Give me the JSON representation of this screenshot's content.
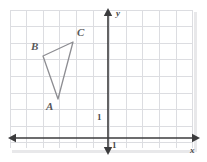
{
  "figure": {
    "type": "coordinate-grid-triangle",
    "background_color": "#ffffff",
    "grid_color": "#dcdde1",
    "axis_color": "#3b3b3d",
    "shape_color": "#8d8d92",
    "label_color": "#58585a"
  },
  "grid": {
    "left": 10,
    "top": 10,
    "right": 193,
    "bottom": 148,
    "cell": 16.6,
    "x_lines": [
      10,
      26.6,
      43.2,
      59.8,
      76.4,
      93,
      109.6,
      126.2,
      142.8,
      159.4,
      176,
      192.6
    ],
    "y_lines": [
      10,
      26.6,
      43.2,
      59.8,
      76.4,
      93,
      109.6,
      126.2,
      142.8
    ]
  },
  "axes": {
    "y_axis": {
      "x": 108,
      "top": 9,
      "bottom": 155,
      "label": "y",
      "label_x": 116,
      "label_y": 9
    },
    "x_axis": {
      "y": 138,
      "left": 9,
      "right": 200,
      "label": "x",
      "label_x": 190,
      "label_y": 146
    },
    "ticks": [
      {
        "label": "1",
        "axis": "y",
        "x": 97,
        "y": 113
      },
      {
        "label": "1",
        "axis": "x",
        "x": 112,
        "y": 141
      }
    ]
  },
  "shape": {
    "name": "triangle-abc",
    "vertices": [
      {
        "name": "A",
        "x": 58,
        "y": 99,
        "label_x": 46,
        "label_y": 101
      },
      {
        "name": "B",
        "x": 43,
        "y": 56,
        "label_x": 31,
        "label_y": 41
      },
      {
        "name": "C",
        "x": 73,
        "y": 42,
        "label_x": 77,
        "label_y": 27
      }
    ],
    "path": "M 58 99 L 43 56 L 73 42 Z"
  }
}
